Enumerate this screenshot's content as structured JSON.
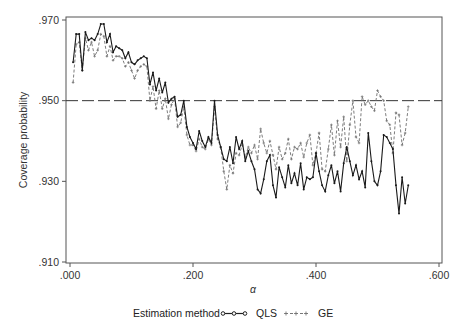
{
  "chart_data": {
    "type": "line",
    "title": "",
    "xlabel": "α",
    "ylabel": "Coverage probability",
    "xlim": [
      0.0,
      0.6
    ],
    "ylim": [
      0.91,
      0.97
    ],
    "xticks": [
      0.0,
      0.2,
      0.4,
      0.6
    ],
    "xtick_labels": [
      ".000",
      ".200",
      ".400",
      ".600"
    ],
    "yticks": [
      0.91,
      0.93,
      0.95,
      0.97
    ],
    "ytick_labels": [
      ".910",
      ".930",
      ".950",
      ".970"
    ],
    "grid": false,
    "reference_line": {
      "y": 0.95,
      "style": "long-dash"
    },
    "legend": {
      "position": "bottom",
      "title": "Estimation method",
      "entries": [
        "QLS",
        "GE"
      ]
    },
    "x": [
      0.005,
      0.01,
      0.015,
      0.02,
      0.025,
      0.03,
      0.035,
      0.04,
      0.045,
      0.05,
      0.055,
      0.06,
      0.065,
      0.07,
      0.075,
      0.08,
      0.085,
      0.09,
      0.095,
      0.1,
      0.105,
      0.11,
      0.115,
      0.12,
      0.125,
      0.13,
      0.135,
      0.14,
      0.145,
      0.15,
      0.155,
      0.16,
      0.165,
      0.17,
      0.175,
      0.18,
      0.185,
      0.19,
      0.195,
      0.2,
      0.205,
      0.21,
      0.215,
      0.22,
      0.225,
      0.23,
      0.235,
      0.24,
      0.245,
      0.25,
      0.255,
      0.26,
      0.265,
      0.27,
      0.275,
      0.28,
      0.285,
      0.29,
      0.295,
      0.3,
      0.305,
      0.31,
      0.315,
      0.32,
      0.325,
      0.33,
      0.335,
      0.34,
      0.345,
      0.35,
      0.355,
      0.36,
      0.365,
      0.37,
      0.375,
      0.38,
      0.385,
      0.39,
      0.395,
      0.4,
      0.405,
      0.41,
      0.415,
      0.42,
      0.425,
      0.43,
      0.435,
      0.44,
      0.445,
      0.45,
      0.455,
      0.46,
      0.465,
      0.47,
      0.475,
      0.48,
      0.485,
      0.49,
      0.495,
      0.5,
      0.505,
      0.51,
      0.515,
      0.52,
      0.525,
      0.53,
      0.535,
      0.54,
      0.545,
      0.55
    ],
    "series": [
      {
        "name": "QLS",
        "style": "solid-with-dots",
        "values": [
          0.9595,
          0.9665,
          0.9665,
          0.9575,
          0.967,
          0.965,
          0.9655,
          0.965,
          0.9665,
          0.969,
          0.969,
          0.9645,
          0.9665,
          0.962,
          0.9635,
          0.963,
          0.9625,
          0.9605,
          0.962,
          0.9595,
          0.959,
          0.96,
          0.9605,
          0.961,
          0.9605,
          0.954,
          0.957,
          0.9525,
          0.9555,
          0.952,
          0.9545,
          0.9495,
          0.9505,
          0.951,
          0.946,
          0.9465,
          0.95,
          0.9435,
          0.941,
          0.9395,
          0.938,
          0.9425,
          0.94,
          0.9385,
          0.941,
          0.9395,
          0.95,
          0.9415,
          0.9385,
          0.9355,
          0.935,
          0.9385,
          0.9345,
          0.941,
          0.938,
          0.94,
          0.935,
          0.9375,
          0.935,
          0.933,
          0.928,
          0.927,
          0.9305,
          0.935,
          0.9365,
          0.929,
          0.926,
          0.9335,
          0.931,
          0.9285,
          0.934,
          0.9295,
          0.932,
          0.929,
          0.9345,
          0.928,
          0.931,
          0.9305,
          0.931,
          0.937,
          0.9325,
          0.929,
          0.9275,
          0.9315,
          0.934,
          0.9295,
          0.9325,
          0.9275,
          0.9345,
          0.9385,
          0.935,
          0.9315,
          0.934,
          0.9305,
          0.9325,
          0.9285,
          0.942,
          0.935,
          0.93,
          0.929,
          0.9325,
          0.9415,
          0.941,
          0.9395,
          0.938,
          0.929,
          0.922,
          0.931,
          0.9245,
          0.929
        ]
      },
      {
        "name": "GE",
        "style": "dashed-with-plus",
        "values": [
          0.9545,
          0.964,
          0.9645,
          0.9575,
          0.9655,
          0.9625,
          0.9645,
          0.961,
          0.9625,
          0.9665,
          0.966,
          0.961,
          0.9635,
          0.96,
          0.961,
          0.961,
          0.9605,
          0.9585,
          0.9595,
          0.9575,
          0.9555,
          0.9575,
          0.9585,
          0.959,
          0.9585,
          0.95,
          0.9535,
          0.948,
          0.9525,
          0.948,
          0.9505,
          0.9455,
          0.949,
          0.9505,
          0.9435,
          0.9445,
          0.9485,
          0.9415,
          0.939,
          0.939,
          0.9375,
          0.9405,
          0.9385,
          0.938,
          0.9405,
          0.939,
          0.9485,
          0.9405,
          0.9385,
          0.9325,
          0.928,
          0.934,
          0.932,
          0.937,
          0.9365,
          0.939,
          0.936,
          0.9385,
          0.937,
          0.939,
          0.9355,
          0.943,
          0.9395,
          0.937,
          0.94,
          0.9365,
          0.933,
          0.9385,
          0.9355,
          0.937,
          0.9405,
          0.9355,
          0.9385,
          0.938,
          0.9395,
          0.936,
          0.9395,
          0.9415,
          0.934,
          0.937,
          0.942,
          0.933,
          0.9325,
          0.938,
          0.944,
          0.9365,
          0.945,
          0.9385,
          0.946,
          0.935,
          0.944,
          0.95,
          0.941,
          0.9395,
          0.951,
          0.949,
          0.95,
          0.9485,
          0.9475,
          0.9525,
          0.951,
          0.95,
          0.945,
          0.944,
          0.937,
          0.947,
          0.9465,
          0.939,
          0.942,
          0.9485
        ]
      }
    ]
  },
  "legend": {
    "title": "Estimation method",
    "items": [
      {
        "label": "QLS"
      },
      {
        "label": "GE"
      }
    ]
  },
  "axes": {
    "xlabel": "α",
    "ylabel": "Coverage probability"
  }
}
